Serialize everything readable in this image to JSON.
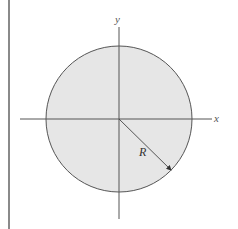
{
  "figure": {
    "type": "circle-with-axes",
    "labels": {
      "x_axis": "x",
      "y_axis": "y",
      "radius": "R"
    },
    "colors": {
      "fill": "#e6e6e6",
      "stroke": "#555555",
      "border": "#8a8a8a"
    }
  }
}
